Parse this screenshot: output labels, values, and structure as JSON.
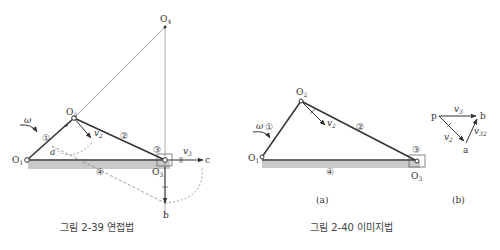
{
  "fig239": {
    "caption": "그림 2-39  연접법",
    "labels": {
      "O4": "O",
      "O4_sub": "4",
      "O2": "O",
      "O2_sub": "2",
      "O1": "O",
      "O1_sub": "1",
      "O3": "O",
      "O3_sub": "3",
      "a": "a",
      "b": "b",
      "c": "c",
      "omega": "ω",
      "v2": "v",
      "v2_sub": "2",
      "v3": "v",
      "v3_sub": "3",
      "link1": "①",
      "link2": "②",
      "link3": "③",
      "link4": "④"
    }
  },
  "fig240": {
    "caption": "그림 2-40  이미지법",
    "sub_a": "(a)",
    "sub_b": "(b)",
    "labels": {
      "O2": "O",
      "O2_sub": "2",
      "O1": "O",
      "O1_sub": "1",
      "O3": "O",
      "O3_sub": "3",
      "omega": "ω",
      "v2": "v",
      "v2_sub": "2",
      "link1": "①",
      "link2": "②",
      "link3": "③",
      "link4": "④"
    },
    "polygon": {
      "p": "p",
      "b": "b",
      "a": "a",
      "v3": "v",
      "v3_sub": "3",
      "v2": "v",
      "v2_sub": "2",
      "v32": "v",
      "v32_sub": "32"
    }
  },
  "colors": {
    "link": "#333333",
    "ground": "#c8c8c8",
    "thin": "#666666"
  }
}
